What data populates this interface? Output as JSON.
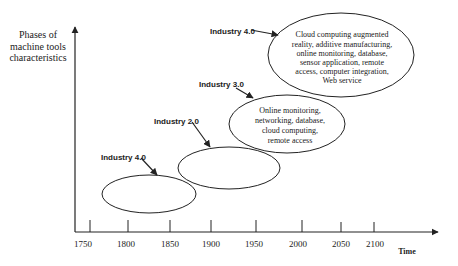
{
  "y_axis": {
    "label_lines": [
      "Phases of",
      "machine tools",
      "characteristics"
    ]
  },
  "x_axis": {
    "label": "Time",
    "ticks": [
      "1750",
      "1800",
      "1850",
      "1900",
      "1950",
      "2000",
      "2050",
      "2100"
    ]
  },
  "phases": [
    {
      "label": "Industry 4.0",
      "lines": []
    },
    {
      "label": "Industry 2.0",
      "lines": []
    },
    {
      "label": "Industry 3.0",
      "lines": [
        "Online monitoring,",
        "networking, database,",
        "cloud computing,",
        "remote access"
      ]
    },
    {
      "label": "Industry 4.0",
      "lines": [
        "Cloud computing augmented",
        "reality, additive manufacturing,",
        "online monitoring, database,",
        "sensor application, remote",
        "access, computer integration,",
        "Web service"
      ]
    }
  ]
}
